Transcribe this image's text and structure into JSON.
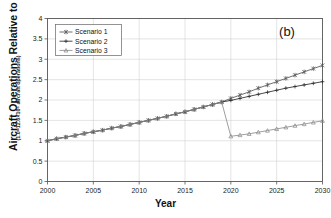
{
  "chart_data": {
    "type": "line",
    "title": "",
    "panel_label": "(b)",
    "xlabel": "Year",
    "ylabel": "Aircraft Operations Relative to 2000",
    "ylabel_sub": "(1.0=12.6×10⁶ aircraft operations)",
    "xlim": [
      2000,
      2030
    ],
    "ylim": [
      0,
      4
    ],
    "xticks": [
      2000,
      2005,
      2010,
      2015,
      2020,
      2025,
      2030
    ],
    "yticks": [
      0,
      0.5,
      1,
      1.5,
      2,
      2.5,
      3,
      3.5,
      4
    ],
    "xtick_labels": [
      "2000",
      "2005",
      "2010",
      "2015",
      "2020",
      "2025",
      "2030"
    ],
    "ytick_labels": [
      "0",
      "0.5",
      "1",
      "1.5",
      "2",
      "2.5",
      "3",
      "3.5",
      "4"
    ],
    "grid": true,
    "legend_position": "top-left",
    "x": [
      2000,
      2001,
      2002,
      2003,
      2004,
      2005,
      2006,
      2007,
      2008,
      2009,
      2010,
      2011,
      2012,
      2013,
      2014,
      2015,
      2016,
      2017,
      2018,
      2019,
      2020,
      2021,
      2022,
      2023,
      2024,
      2025,
      2026,
      2027,
      2028,
      2029,
      2030
    ],
    "series": [
      {
        "name": "Scenario 1",
        "marker": "asterisk",
        "color": "#555555",
        "values": [
          1.0,
          1.05,
          1.09,
          1.13,
          1.18,
          1.22,
          1.26,
          1.31,
          1.35,
          1.4,
          1.45,
          1.5,
          1.55,
          1.6,
          1.66,
          1.71,
          1.77,
          1.83,
          1.89,
          1.95,
          2.04,
          2.12,
          2.2,
          2.29,
          2.37,
          2.45,
          2.53,
          2.61,
          2.69,
          2.77,
          2.85
        ]
      },
      {
        "name": "Scenario 2",
        "marker": "plus",
        "color": "#2b2b2b",
        "values": [
          1.0,
          1.05,
          1.09,
          1.13,
          1.18,
          1.22,
          1.26,
          1.31,
          1.35,
          1.4,
          1.45,
          1.5,
          1.55,
          1.6,
          1.66,
          1.71,
          1.77,
          1.83,
          1.89,
          1.95,
          1.99,
          2.04,
          2.09,
          2.14,
          2.19,
          2.24,
          2.29,
          2.33,
          2.37,
          2.41,
          2.45
        ]
      },
      {
        "name": "Scenario 3",
        "marker": "triangle",
        "color": "#8c8c8c",
        "values": [
          1.0,
          1.05,
          1.09,
          1.13,
          1.18,
          1.22,
          1.26,
          1.31,
          1.35,
          1.4,
          1.45,
          1.5,
          1.55,
          1.6,
          1.66,
          1.71,
          1.77,
          1.83,
          1.89,
          1.95,
          1.11,
          1.14,
          1.17,
          1.21,
          1.25,
          1.29,
          1.33,
          1.37,
          1.41,
          1.45,
          1.49
        ]
      }
    ],
    "legend": [
      "Scenario 1",
      "Scenario 2",
      "Scenario 3"
    ],
    "annotations": [
      "Scenario 3 drops sharply between 2019 and 2020 from 1.95 to 1.11"
    ]
  }
}
